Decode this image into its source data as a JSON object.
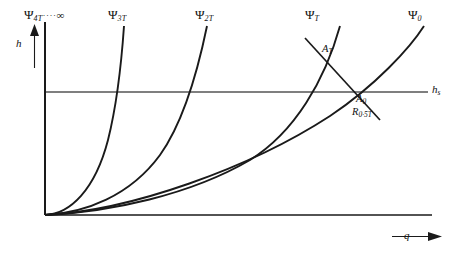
{
  "figure": {
    "background_color": "#ffffff",
    "line_color": "#1a1a1a",
    "axis_color": "#1a1a1a"
  },
  "axes": {
    "y_label": "h",
    "x_label": "q",
    "static_head_label": "h",
    "static_head_sub": "s",
    "origin": {
      "x": 45,
      "y": 215
    },
    "x_end": 432,
    "y_top": 22,
    "static_head_y": 92
  },
  "curves": [
    {
      "id": "psi-4t-inf",
      "psi": "Ψ",
      "sub": "4T",
      "dots": "····",
      "suffix": "∞",
      "label_x": 24,
      "label_y": 14,
      "path": "M45,215 L45,22",
      "shape": "vertical"
    },
    {
      "id": "psi-3t",
      "psi": "Ψ",
      "sub": "3T",
      "dots": "",
      "suffix": "",
      "label_x": 108,
      "label_y": 14,
      "path": "M45,215 C70,214 95,190 108,140 C118,100 122,55 124,26",
      "shape": "curve"
    },
    {
      "id": "psi-2t",
      "psi": "Ψ",
      "sub": "2T",
      "dots": "",
      "suffix": "",
      "label_x": 195,
      "label_y": 14,
      "path": "M45,215 C85,213 130,196 160,155 C185,120 200,60 207,26",
      "shape": "curve"
    },
    {
      "id": "psi-t",
      "psi": "Ψ",
      "sub": "T",
      "dots": "",
      "suffix": "",
      "label_x": 305,
      "label_y": 14,
      "path": "M45,215 C110,212 190,195 250,160 C295,132 325,80 340,26",
      "shape": "curve"
    },
    {
      "id": "psi-0",
      "psi": "Ψ",
      "sub": "0",
      "dots": "",
      "suffix": "",
      "label_x": 408,
      "label_y": 14,
      "path": "M45,215 C130,211 250,168 330,116 C375,86 410,48 424,26",
      "shape": "curve"
    }
  ],
  "operating_points": [
    {
      "id": "a-t",
      "label": "A",
      "sub": "T",
      "label_x": 322,
      "label_y": 48,
      "marker_x": 340,
      "marker_y": 60
    },
    {
      "id": "a-0",
      "label": "A",
      "sub": "0",
      "label_x": 356,
      "label_y": 97,
      "marker_x": 349,
      "marker_y": 92
    },
    {
      "id": "r-05t",
      "label": "R",
      "sub": "0·5T",
      "label_x": 352,
      "label_y": 110,
      "marker_x": 349,
      "marker_y": 92
    }
  ],
  "resistance_line": {
    "id": "resistance-line",
    "description": "straight line through A_T and A_0",
    "path": "M305,38 L380,120"
  }
}
